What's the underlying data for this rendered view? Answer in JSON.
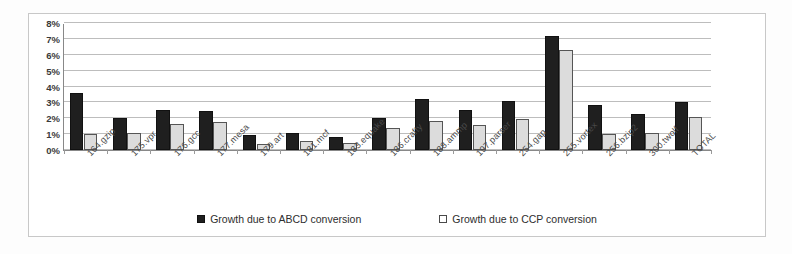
{
  "chart_data": {
    "type": "bar",
    "title": "",
    "xlabel": "",
    "ylabel": "",
    "ylim": [
      0,
      8
    ],
    "ytick_labels": [
      "8%",
      "7%",
      "6%",
      "5%",
      "4%",
      "3%",
      "2%",
      "1%",
      "0%"
    ],
    "ytick_values": [
      8,
      7,
      6,
      5,
      4,
      3,
      2,
      1,
      0
    ],
    "grid": true,
    "legend_position": "bottom-center",
    "categories": [
      "164.gzip",
      "175.vpr",
      "176.gcc",
      "177.mesa",
      "179.art",
      "181.mcf",
      "183.equake",
      "186.crafty",
      "188.ammp",
      "197.parser",
      "254.gap",
      "255.vortex",
      "256.bzip2",
      "300.twolf",
      "TOTAL"
    ],
    "series": [
      {
        "name": "Growth due to ABCD conversion",
        "color": "#1f1f1f",
        "values": [
          3.6,
          2.0,
          2.5,
          2.45,
          0.95,
          1.05,
          0.85,
          2.0,
          3.2,
          2.55,
          3.1,
          7.2,
          2.85,
          2.3,
          3.0
        ]
      },
      {
        "name": "Growth due to CCP conversion",
        "color": "#dcdcdc",
        "values": [
          1.0,
          1.1,
          1.65,
          1.75,
          0.4,
          0.55,
          0.45,
          1.4,
          1.85,
          1.6,
          1.95,
          6.3,
          1.0,
          1.05,
          2.1
        ]
      }
    ]
  },
  "legend": {
    "entries": [
      {
        "label": "Growth due to ABCD conversion",
        "marker": "filled-square-icon"
      },
      {
        "label": "Growth due to CCP conversion",
        "marker": "hollow-square-icon"
      }
    ]
  }
}
